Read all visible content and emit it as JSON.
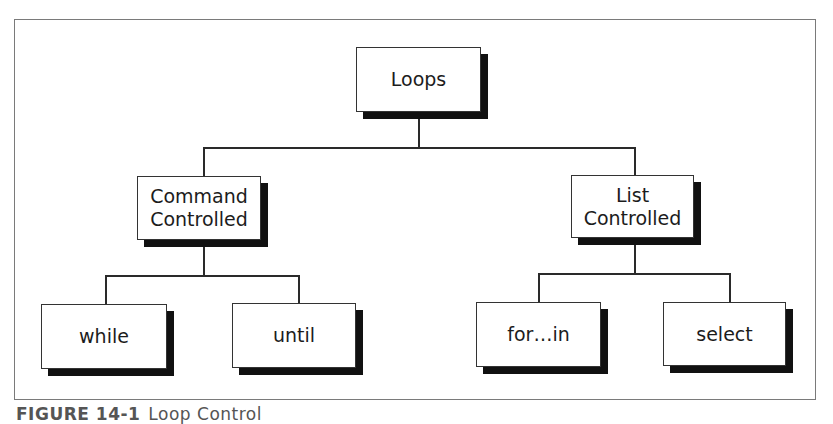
{
  "diagram": {
    "type": "tree",
    "root": {
      "label": "Loops",
      "children": [
        {
          "label": "Command\nControlled",
          "children": [
            {
              "label": "while"
            },
            {
              "label": "until"
            }
          ]
        },
        {
          "label": "List\nControlled",
          "children": [
            {
              "label": "for…in"
            },
            {
              "label": "select"
            }
          ]
        }
      ]
    }
  },
  "nodes": {
    "loops": "Loops",
    "command_line1": "Command",
    "command_line2": "Controlled",
    "list_line1": "List",
    "list_line2": "Controlled",
    "while": "while",
    "until": "until",
    "for_in": "for…in",
    "select": "select"
  },
  "caption": {
    "figure": "FIGURE 14-1",
    "title": "Loop Control"
  },
  "colors": {
    "border": "#333333",
    "shadow": "#111111",
    "frame": "#7a7a7a"
  }
}
